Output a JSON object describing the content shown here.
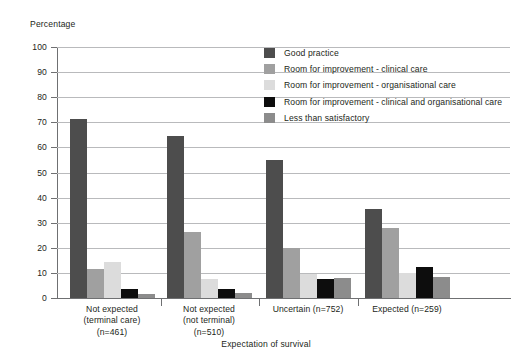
{
  "chart_data": {
    "type": "bar",
    "title": "",
    "ylabel": "Percentage",
    "xlabel": "Expectation of survival",
    "ylim": [
      0,
      100
    ],
    "yticks": [
      0,
      10,
      20,
      30,
      40,
      50,
      60,
      70,
      80,
      90,
      100
    ],
    "ytick_labels": [
      "0",
      "10",
      "20",
      "30",
      "40",
      "50",
      "60",
      "70",
      "80",
      "90",
      "100"
    ],
    "grid": true,
    "legend_position": "upper-right-inside",
    "categories": [
      "Not expected (terminal care) (n=461)",
      "Not expected (not terminal) (n=510)",
      "Uncertain (n=752)",
      "Expected (n=259)"
    ],
    "category_lines": [
      [
        "Not expected",
        "(terminal care)",
        "(n=461)"
      ],
      [
        "Not expected",
        "(not terminal)",
        "(n=510)"
      ],
      [
        "Uncertain (n=752)"
      ],
      [
        "Expected (n=259)"
      ]
    ],
    "series": [
      {
        "name": "Good practice",
        "color": "#4d4d4d",
        "values": [
          71.5,
          64.5,
          55,
          35.5
        ]
      },
      {
        "name": "Room for improvement - clinical care",
        "color": "#a0a0a0",
        "values": [
          11.5,
          26.5,
          20,
          28
        ]
      },
      {
        "name": "Room for improvement - organisational care",
        "color": "#dcdcdc",
        "values": [
          14.5,
          7.5,
          9.5,
          10
        ]
      },
      {
        "name": "Room for improvement - clinical and organisational care",
        "color": "#0d0d0d",
        "values": [
          3.5,
          3.5,
          7.5,
          12.5
        ]
      },
      {
        "name": "Less than satisfactory",
        "color": "#8c8c8c",
        "values": [
          1.5,
          2,
          8,
          8.5
        ]
      }
    ]
  },
  "colors": {
    "axis": "#6f7072",
    "gridline": "#b9babc",
    "text": "#231f20",
    "background": "#ffffff"
  }
}
